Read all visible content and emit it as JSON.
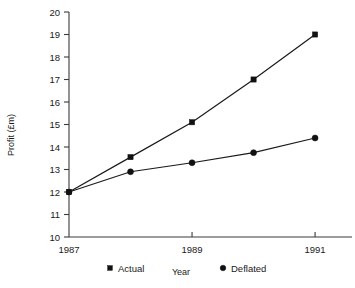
{
  "chart_data": {
    "type": "line",
    "title": "",
    "xlabel": "Year",
    "ylabel": "Profit (£m)",
    "xlim": [
      1987,
      1991.6
    ],
    "ylim": [
      10,
      20
    ],
    "grid": false,
    "legend_position": "bottom",
    "x": [
      1987,
      1988,
      1989,
      1990,
      1991
    ],
    "xtick_values": [
      1987,
      1989,
      1991
    ],
    "xtick_labels": [
      "1987",
      "1989",
      "1991"
    ],
    "ytick_values": [
      10,
      11,
      12,
      13,
      14,
      15,
      16,
      17,
      18,
      19,
      20
    ],
    "ytick_labels": [
      "10",
      "11",
      "12",
      "13",
      "14",
      "15",
      "16",
      "17",
      "18",
      "19",
      "20"
    ],
    "series": [
      {
        "name": "Actual",
        "marker": "square",
        "color": "#111111",
        "values": [
          12.0,
          13.55,
          15.1,
          17.0,
          19.0
        ]
      },
      {
        "name": "Deflated",
        "marker": "circle",
        "color": "#111111",
        "values": [
          12.0,
          12.9,
          13.3,
          13.75,
          14.4
        ]
      }
    ],
    "legend": [
      {
        "label": "Actual",
        "marker": "square"
      },
      {
        "label": "Deflated",
        "marker": "circle"
      }
    ]
  }
}
